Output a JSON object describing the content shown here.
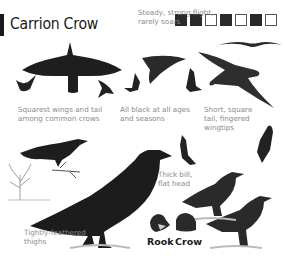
{
  "page": {
    "title": "Carrion Crow",
    "habitat_icons": [
      {
        "name": "house-icon",
        "meaning": "towns"
      },
      {
        "name": "farmland-icon",
        "meaning": "farmland"
      },
      {
        "name": "grassland-icon",
        "meaning": "grassland"
      },
      {
        "name": "coast-icon",
        "meaning": "coast"
      },
      {
        "name": "wetland-icon",
        "meaning": "wetland"
      },
      {
        "name": "hills-icon",
        "meaning": "upland"
      },
      {
        "name": "woodland-icon",
        "meaning": "woodland"
      }
    ],
    "captions": {
      "flight": "Steady, strong flight,\nrarely soars",
      "wings": "Squarest wings and tail\namong common crows",
      "black": "All black at all ages\nand seasons",
      "tail": "Short, square\ntail, fingered\nwingtips",
      "bill": "Thick bill,\nflat head",
      "thighs": "Tightly-feathered\nthighs"
    },
    "comparison": {
      "left": "Rook",
      "right": "Crow"
    }
  }
}
